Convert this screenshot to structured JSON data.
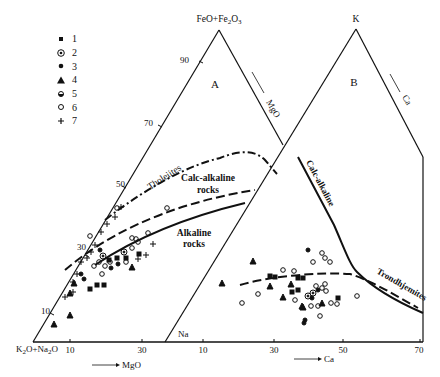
{
  "legend": [
    {
      "symbol": "filled-square",
      "label": "1"
    },
    {
      "symbol": "circle-dot",
      "label": "2"
    },
    {
      "symbol": "filled-circle",
      "label": "3"
    },
    {
      "symbol": "filled-triangle",
      "label": "4"
    },
    {
      "symbol": "half-filled-circle",
      "label": "5"
    },
    {
      "symbol": "open-circle",
      "label": "6"
    },
    {
      "symbol": "plus",
      "label": "7"
    }
  ],
  "diagram_a": {
    "panel_label": "A",
    "apex_label": "FeO+Fe2O3",
    "left_vertex_label": "K2O+Na2O",
    "side_arrow_label": "MgO",
    "bottom_arrow_label": "MgO",
    "left_ticks": [
      "90",
      "70",
      "50",
      "30",
      "10"
    ],
    "bottom_ticks": [
      "10",
      "30"
    ],
    "fields": {
      "tholeiites": "Tholeiites",
      "calc_alkaline_1": "Calc-alkaline",
      "calc_alkaline_2": "rocks",
      "alkaline_1": "Alkaline",
      "alkaline_2": "rocks"
    }
  },
  "diagram_b": {
    "panel_label": "B",
    "apex_label": "K",
    "left_vertex_label": "Na",
    "side_arrow_label": "Ca",
    "bottom_arrow_label": "Ca",
    "bottom_ticks": [
      "10",
      "30",
      "50",
      "70"
    ],
    "fields": {
      "calc_alkaline": "Calc-alkaline",
      "trondhjemites": "Trondhjemites"
    }
  }
}
